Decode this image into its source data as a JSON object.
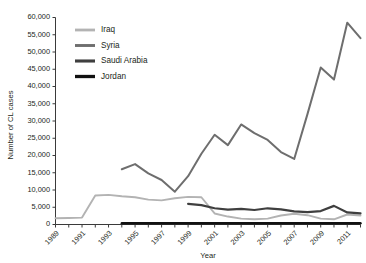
{
  "chart_data": {
    "type": "line",
    "title": "",
    "xlabel": "Year",
    "ylabel": "Number of CL cases",
    "xlim": [
      1989,
      2012
    ],
    "ylim": [
      0,
      60000
    ],
    "ytick_step": 5000,
    "grid": false,
    "legend_position": "top-center",
    "x": [
      1989,
      1990,
      1991,
      1992,
      1993,
      1994,
      1995,
      1996,
      1997,
      1998,
      1999,
      2000,
      2001,
      2002,
      2003,
      2004,
      2005,
      2006,
      2007,
      2008,
      2009,
      2010,
      2011,
      2012
    ],
    "ytick_labels": [
      "0",
      "5,000",
      "10,000",
      "15,000",
      "20,000",
      "25,000",
      "30,000",
      "35,000",
      "40,000",
      "45,000",
      "50,000",
      "55,000",
      "60,000"
    ],
    "ytick_values": [
      0,
      5000,
      10000,
      15000,
      20000,
      25000,
      30000,
      35000,
      40000,
      45000,
      50000,
      55000,
      60000
    ],
    "xtick_labels": [
      "1989",
      "1991",
      "1993",
      "1995",
      "1997",
      "1999",
      "2001",
      "2003",
      "2005",
      "2007",
      "2009",
      "2011"
    ],
    "xtick_values": [
      1989,
      1991,
      1993,
      1995,
      1997,
      1999,
      2001,
      2003,
      2005,
      2007,
      2009,
      2011
    ],
    "series": [
      {
        "name": "Iraq",
        "color": "#b3b3b3",
        "width": 1.9,
        "x": [
          1989,
          1990,
          1991,
          1992,
          1993,
          1994,
          1995,
          1996,
          1997,
          1998,
          1999,
          2000,
          2001,
          2002,
          2003,
          2004,
          2005,
          2006,
          2007,
          2008,
          2009,
          2010,
          2011,
          2012
        ],
        "values": [
          1800,
          1900,
          2000,
          8400,
          8600,
          8200,
          7900,
          7200,
          7000,
          7600,
          8000,
          7900,
          3200,
          2300,
          1700,
          1500,
          1700,
          2600,
          3100,
          2700,
          1700,
          1500,
          2900,
          2600
        ]
      },
      {
        "name": "Syria",
        "color": "#6e6e6e",
        "width": 2.0,
        "x": [
          1994,
          1995,
          1996,
          1997,
          1998,
          1999,
          2000,
          2001,
          2002,
          2003,
          2004,
          2005,
          2006,
          2007,
          2008,
          2009,
          2010,
          2011,
          2012
        ],
        "values": [
          16000,
          17500,
          14800,
          12900,
          9500,
          14000,
          20500,
          26000,
          23000,
          29000,
          26500,
          24500,
          21000,
          19000,
          32000,
          45500,
          42000,
          58500,
          54000
        ]
      },
      {
        "name": "Saudi Arabia",
        "color": "#3f3f3f",
        "width": 2.2,
        "x": [
          1999,
          2000,
          2001,
          2002,
          2003,
          2004,
          2005,
          2006,
          2007,
          2008,
          2009,
          2010,
          2011,
          2012
        ],
        "values": [
          6000,
          5600,
          4700,
          4300,
          4500,
          4200,
          4700,
          4400,
          3800,
          3600,
          3900,
          5400,
          3500,
          3200
        ]
      },
      {
        "name": "Jordan",
        "color": "#111111",
        "width": 2.4,
        "x": [
          1994,
          1995,
          1996,
          1997,
          1998,
          1999,
          2000,
          2001,
          2002,
          2003,
          2004,
          2005,
          2006,
          2007,
          2008,
          2009,
          2010,
          2011,
          2012
        ],
        "values": [
          350,
          350,
          350,
          350,
          350,
          350,
          350,
          350,
          350,
          350,
          350,
          350,
          350,
          350,
          350,
          350,
          350,
          350,
          350
        ]
      }
    ]
  },
  "legend": {
    "items": [
      {
        "label": "Iraq"
      },
      {
        "label": "Syria"
      },
      {
        "label": "Saudi Arabia"
      },
      {
        "label": "Jordan"
      }
    ]
  }
}
